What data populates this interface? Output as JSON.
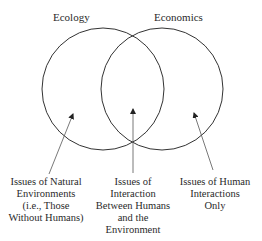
{
  "diagram": {
    "type": "venn",
    "sets": [
      {
        "label": "Ecology"
      },
      {
        "label": "Economics"
      }
    ],
    "regions": [
      {
        "id": "ecology-only",
        "lines": [
          "Issues of Natural",
          "Environments",
          "(i.e., Those",
          "Without Humans)"
        ]
      },
      {
        "id": "intersection",
        "lines": [
          "Issues of",
          "Interaction",
          "Between Humans",
          "and the",
          "Environment"
        ]
      },
      {
        "id": "economics-only",
        "lines": [
          "Issues of Human",
          "Interactions",
          "Only"
        ]
      }
    ],
    "colors": {
      "stroke": "#333333",
      "text": "#2a2a2a",
      "background": "#ffffff"
    }
  }
}
